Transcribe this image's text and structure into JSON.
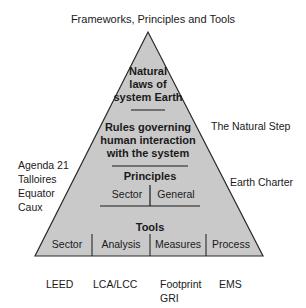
{
  "title": "Frameworks, Principles and Tools",
  "pyramid": {
    "fill": "#c9c9c9",
    "stroke": "#2a2a2a",
    "natural_laws": [
      "Natural",
      "laws of",
      "system Earth"
    ],
    "rules": [
      "Rules governing",
      "human interaction",
      "with the system"
    ],
    "principles": {
      "heading": "Principles",
      "cells": [
        "Sector",
        "General"
      ]
    },
    "tools": {
      "heading": "Tools",
      "cells": [
        "Sector",
        "Analysis",
        "Measures",
        "Process"
      ]
    }
  },
  "frameworks_left": [
    "Agenda 21",
    "Talloires",
    "Equator",
    "Caux"
  ],
  "frameworks_right": {
    "natural_step": "The Natural Step",
    "earth_charter": "Earth Charter"
  },
  "tools_below": [
    {
      "lines": [
        "LEED"
      ]
    },
    {
      "lines": [
        "LCA/LCC"
      ]
    },
    {
      "lines": [
        "Footprint",
        "GRI"
      ]
    },
    {
      "lines": [
        "EMS"
      ]
    }
  ]
}
